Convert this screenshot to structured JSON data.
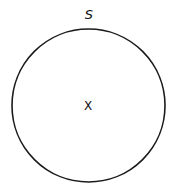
{
  "diagram": {
    "shape": "circle",
    "circle_label": "S",
    "center_label": "X",
    "stroke_color": "#1a1a1a",
    "background": "#ffffff"
  }
}
